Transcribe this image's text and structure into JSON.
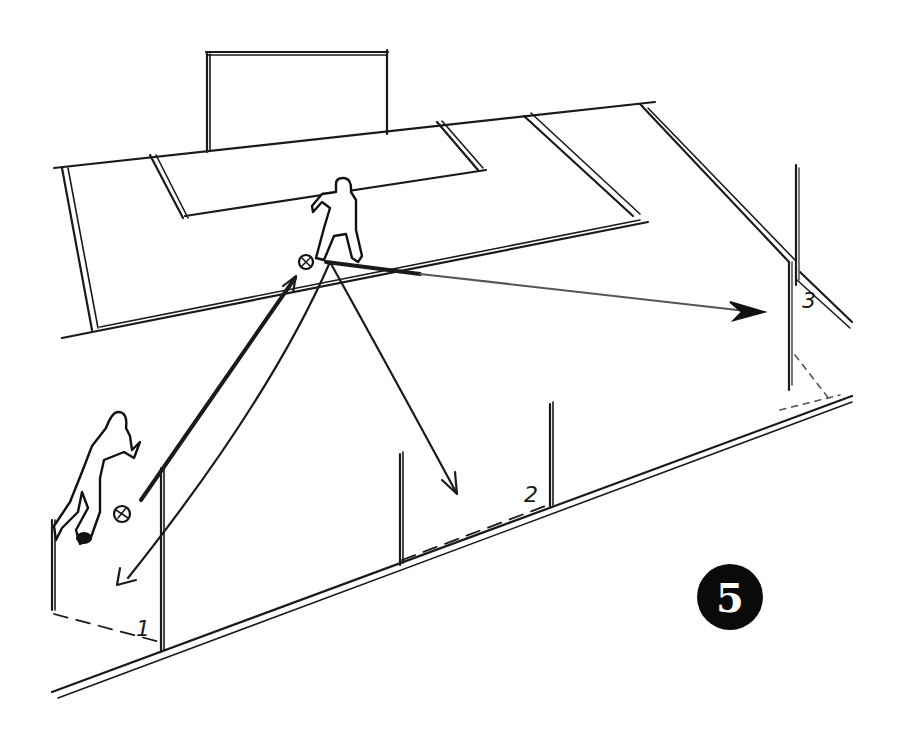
{
  "diagram": {
    "type": "soccer-passing-drill-sketch",
    "step_number": "5",
    "gate_labels": [
      "1",
      "2",
      "3"
    ],
    "players": [
      {
        "role": "server-with-ball",
        "position": "bottom-left near gate 1"
      },
      {
        "role": "receiver",
        "position": "center near edge of penalty area"
      }
    ],
    "arrows": [
      {
        "from": "server",
        "to": "receiver",
        "style": "thick straight pass"
      },
      {
        "from": "receiver",
        "to": "gate-1",
        "style": "curved return"
      },
      {
        "from": "receiver",
        "to": "gate-2",
        "style": "curved pass"
      },
      {
        "from": "receiver",
        "to": "gate-3",
        "style": "long pass"
      }
    ],
    "colors": {
      "ink": "#1a1a1a",
      "paper": "#ffffff",
      "badge": "#0a0a0a"
    }
  }
}
